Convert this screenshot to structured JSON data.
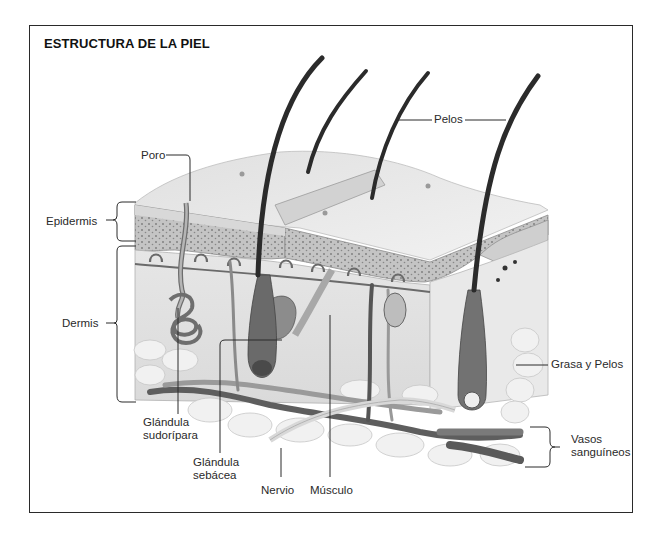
{
  "title": "ESTRUCTURA DE LA PIEL",
  "labels": {
    "pelos": "Pelos",
    "poro": "Poro",
    "epidermis": "Epidermis",
    "dermis": "Dermis",
    "glandula_sudoripara_1": "Glándula",
    "glandula_sudoripara_2": "sudorípara",
    "glandula_sebacea_1": "Glándula",
    "glandula_sebacea_2": "sebácea",
    "nervio": "Nervio",
    "musculo": "Músculo",
    "grasa_y_pelos": "Grasa y Pelos",
    "vasos_1": "Vasos",
    "vasos_2": "sanguíneos"
  },
  "colors": {
    "frame": "#2a2a2a",
    "hair": "#2b2b2b",
    "skin_top": "#ececec",
    "epidermis": "#bdbdbd",
    "dermis": "#e2e2e2",
    "fat": "#f2f2f2",
    "vessel": "#6e6e6e"
  }
}
